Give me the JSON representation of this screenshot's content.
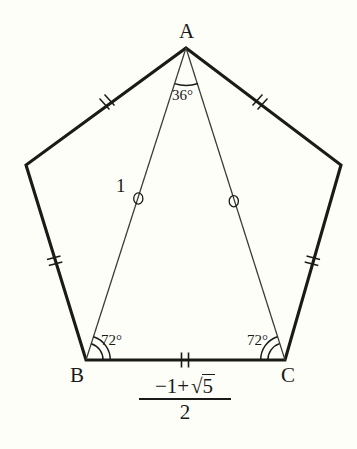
{
  "figure": {
    "background_color": "#fefef8",
    "stroke_color": "#1a1a18",
    "vertices": {
      "A": {
        "label": "A",
        "x": 186,
        "y": 48
      },
      "B": {
        "label": "B",
        "x": 86,
        "y": 360
      },
      "C": {
        "label": "C",
        "x": 285,
        "y": 360
      },
      "left": {
        "label": "",
        "x": 26,
        "y": 165
      },
      "right": {
        "label": "",
        "x": 341,
        "y": 165
      }
    },
    "angles": [
      {
        "name": "angle-at-a",
        "value": "36°",
        "vertex": "A",
        "arcs": 1
      },
      {
        "name": "angle-at-b",
        "value": "72°",
        "vertex": "B",
        "arcs": 2
      },
      {
        "name": "angle-at-c",
        "value": "72°",
        "vertex": "C",
        "arcs": 2
      }
    ],
    "lengths": {
      "cevian_label": "1",
      "base_numerator": "−1+√5",
      "base_denominator": "2",
      "base_numerator_lead": "−1+",
      "base_numerator_radicand": "5",
      "radical_symbol": "√"
    },
    "tick_marks": {
      "pentagon_sides": "double-slash",
      "base_side": "double-vertical",
      "cevians": "circle"
    }
  }
}
